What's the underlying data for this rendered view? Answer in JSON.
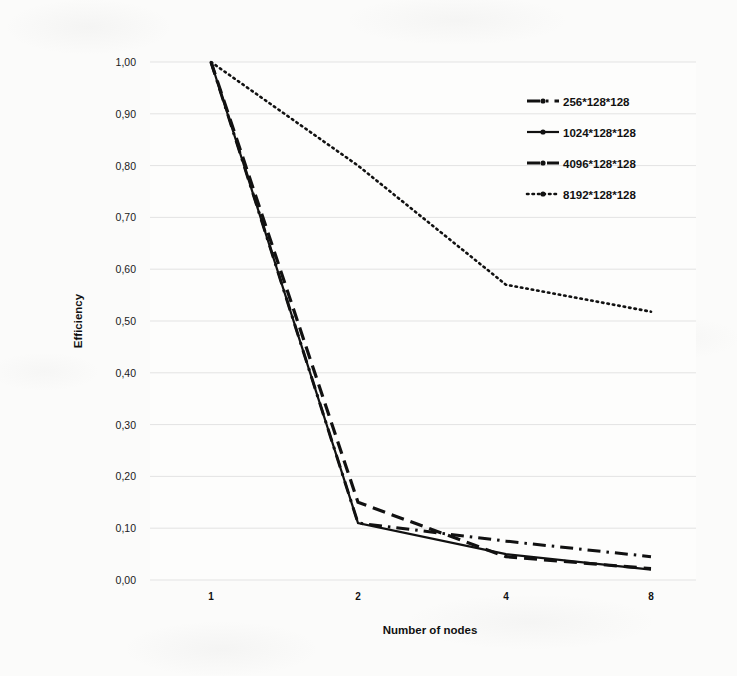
{
  "chart_data": {
    "type": "line",
    "title": "",
    "xlabel": "Number of nodes",
    "ylabel": "Efficiency",
    "categories": [
      "1",
      "2",
      "4",
      "8"
    ],
    "ylim": [
      0.0,
      1.0
    ],
    "ytick_labels": [
      "0,00",
      "0,10",
      "0,20",
      "0,30",
      "0,40",
      "0,50",
      "0,60",
      "0,70",
      "0,80",
      "0,90",
      "1,00"
    ],
    "ytick_values": [
      0.0,
      0.1,
      0.2,
      0.3,
      0.4,
      0.5,
      0.6,
      0.7,
      0.8,
      0.9,
      1.0
    ],
    "grid": "horizontal",
    "legend_position": "top-right",
    "series": [
      {
        "name": "256*128*128",
        "style": "dash-dot",
        "values": [
          1.0,
          0.11,
          0.075,
          0.045
        ]
      },
      {
        "name": "1024*128*128",
        "style": "solid",
        "values": [
          1.0,
          0.11,
          0.05,
          0.02
        ]
      },
      {
        "name": "4096*128*128",
        "style": "dashed",
        "values": [
          1.0,
          0.15,
          0.045,
          0.022
        ]
      },
      {
        "name": "8192*128*128",
        "style": "dotted",
        "values": [
          1.0,
          0.8,
          0.57,
          0.518
        ]
      }
    ]
  },
  "axes": {
    "y_title": "Efficiency",
    "x_title": "Number of nodes"
  },
  "legend": {
    "entries": [
      {
        "label": "256*128*128"
      },
      {
        "label": "1024*128*128"
      },
      {
        "label": "4096*128*128"
      },
      {
        "label": "8192*128*128"
      }
    ]
  },
  "colors": {
    "ink": "#111111",
    "grid": "#e3e3e3",
    "paper": "#fbfbfa"
  }
}
